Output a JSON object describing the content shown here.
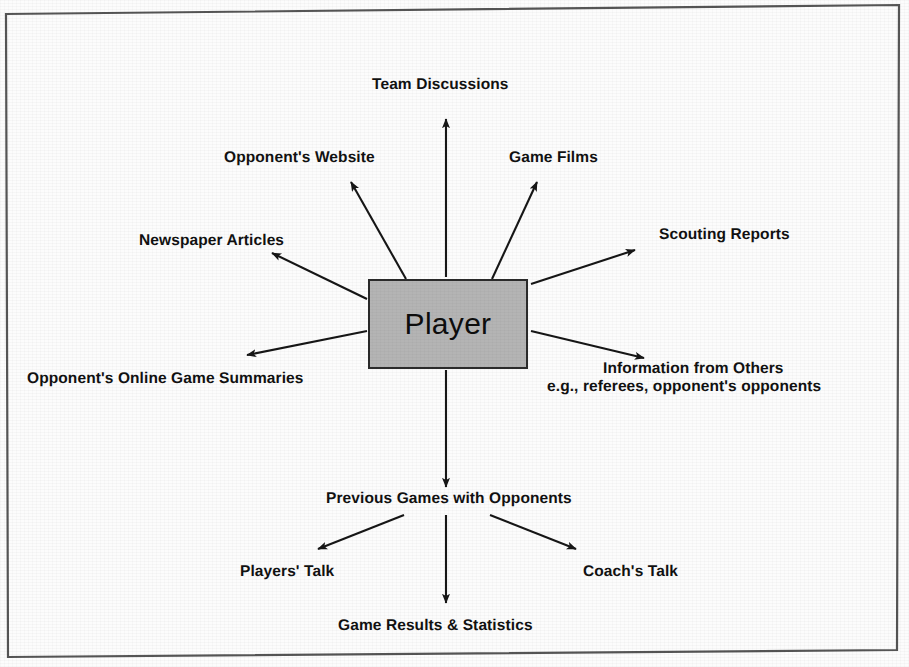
{
  "diagram": {
    "frame": {
      "border_color": "#4a4a4a",
      "background_color": "#fcfcfc"
    },
    "center_node": {
      "label": "Player",
      "fill_color": "#b4b4b4",
      "border_color": "#2b2b2b"
    },
    "nodes": [
      {
        "id": "team-discussions",
        "label": "Team Discussions"
      },
      {
        "id": "opponents-website",
        "label": "Opponent's Website"
      },
      {
        "id": "game-films",
        "label": "Game Films"
      },
      {
        "id": "newspaper-articles",
        "label": "Newspaper Articles"
      },
      {
        "id": "scouting-reports",
        "label": "Scouting Reports"
      },
      {
        "id": "opponents-online-game-summaries",
        "label": "Opponent's Online Game Summaries"
      },
      {
        "id": "information-from-others-line1",
        "label": "Information from Others"
      },
      {
        "id": "information-from-others-line2",
        "label": "e.g., referees, opponent's opponents"
      },
      {
        "id": "previous-games-with-opponents",
        "label": "Previous Games with Opponents"
      },
      {
        "id": "players-talk",
        "label": "Players' Talk"
      },
      {
        "id": "coachs-talk",
        "label": "Coach's Talk"
      },
      {
        "id": "game-results-statistics",
        "label": "Game Results & Statistics"
      }
    ],
    "edges": [
      {
        "from": "Player",
        "to": "Team Discussions"
      },
      {
        "from": "Player",
        "to": "Opponent's Website"
      },
      {
        "from": "Player",
        "to": "Game Films"
      },
      {
        "from": "Player",
        "to": "Newspaper Articles"
      },
      {
        "from": "Player",
        "to": "Scouting Reports"
      },
      {
        "from": "Player",
        "to": "Opponent's Online Game Summaries"
      },
      {
        "from": "Player",
        "to": "Information from Others"
      },
      {
        "from": "Player",
        "to": "Previous Games with Opponents"
      },
      {
        "from": "Previous Games with Opponents",
        "to": "Players' Talk"
      },
      {
        "from": "Previous Games with Opponents",
        "to": "Game Results & Statistics"
      },
      {
        "from": "Previous Games with Opponents",
        "to": "Coach's Talk"
      }
    ]
  }
}
